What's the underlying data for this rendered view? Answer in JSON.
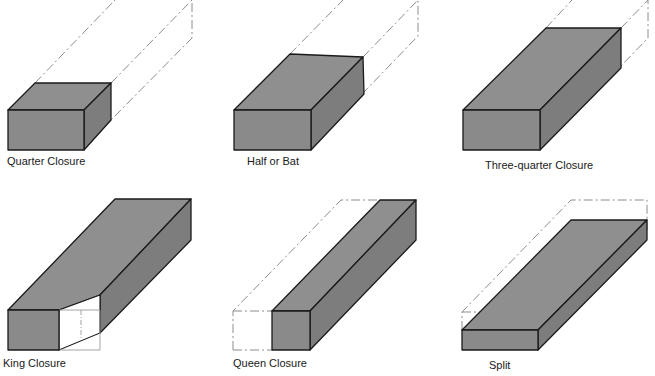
{
  "figure": {
    "type": "brick closure illustrations",
    "fill_color": "#8a8a8a",
    "outline_color": "#1a1a1a",
    "ghost_color": "#8c8c8c",
    "panels": [
      {
        "id": "quarter",
        "label": "Quarter Closure"
      },
      {
        "id": "half",
        "label": "Half or Bat"
      },
      {
        "id": "three-quarter",
        "label": "Three-quarter Closure"
      },
      {
        "id": "king",
        "label": "King Closure"
      },
      {
        "id": "queen",
        "label": "Queen Closure"
      },
      {
        "id": "split",
        "label": "Split"
      }
    ]
  }
}
